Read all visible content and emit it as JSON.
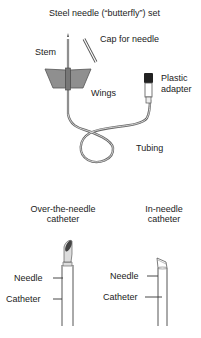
{
  "top_figure": {
    "title": "Steel needle (“butterfly”) set",
    "labels": {
      "stem": "Stem",
      "cap": "Cap for needle",
      "wings": "Wings",
      "adapter_line1": "Plastic",
      "adapter_line2": "adapter",
      "tubing": "Tubing"
    }
  },
  "bottom_figures": [
    {
      "title_line1": "Over-the-needle",
      "title_line2": "catheter",
      "needle_label": "Needle",
      "catheter_label": "Catheter"
    },
    {
      "title_line1": "In-needle",
      "title_line2": "catheter",
      "needle_label": "Needle",
      "catheter_label": "Catheter"
    }
  ],
  "colors": {
    "line": "#555555",
    "wing_fill": "#8a8a8a",
    "tip_fill": "#444444",
    "adapter_cap": "#222222"
  }
}
